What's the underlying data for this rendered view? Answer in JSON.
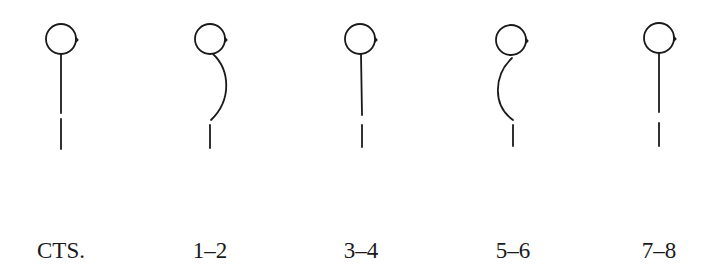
{
  "diagram": {
    "stroke_color": "#1a1a1a",
    "figures": [
      {
        "id": "cts",
        "label": "CTS.",
        "cx": 61,
        "shape": "straight"
      },
      {
        "id": "1-2",
        "label": "1–2",
        "cx": 210,
        "shape": "curve-right"
      },
      {
        "id": "3-4",
        "label": "3–4",
        "cx": 361,
        "shape": "straight"
      },
      {
        "id": "5-6",
        "label": "5–6",
        "cx": 512,
        "shape": "curve-left"
      },
      {
        "id": "7-8",
        "label": "7–8",
        "cx": 659,
        "shape": "straight"
      }
    ]
  }
}
